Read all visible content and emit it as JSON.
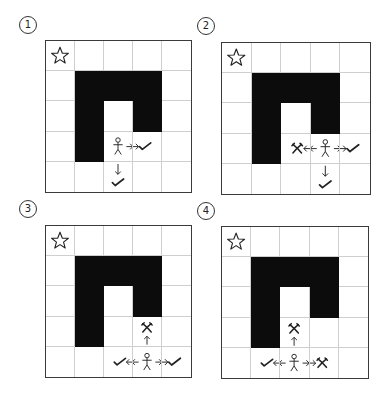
{
  "figure": {
    "grid_size": 5,
    "walls": [
      [
        1,
        1
      ],
      [
        1,
        2
      ],
      [
        1,
        3
      ],
      [
        2,
        1
      ],
      [
        2,
        3
      ],
      [
        3,
        1
      ]
    ],
    "star": [
      0,
      0
    ],
    "panels": [
      {
        "label": "1",
        "position": {
          "label_x": 19,
          "label_y": 16,
          "grid_x": 45,
          "grid_y": 40,
          "grid_w": 147,
          "grid_h": 153
        },
        "agent": [
          3,
          2
        ],
        "moves": [
          {
            "direction": "right",
            "result": "check"
          },
          {
            "direction": "down",
            "result": "check"
          }
        ]
      },
      {
        "label": "2",
        "position": {
          "label_x": 197,
          "label_y": 17,
          "grid_x": 221,
          "grid_y": 42,
          "grid_w": 150,
          "grid_h": 153
        },
        "agent": [
          3,
          3
        ],
        "moves": [
          {
            "direction": "left",
            "result": "cross"
          },
          {
            "direction": "right",
            "result": "check"
          },
          {
            "direction": "down",
            "result": "check"
          }
        ]
      },
      {
        "label": "3",
        "position": {
          "label_x": 19,
          "label_y": 200,
          "grid_x": 45,
          "grid_y": 225,
          "grid_w": 147,
          "grid_h": 153
        },
        "agent": [
          4,
          3
        ],
        "moves": [
          {
            "direction": "up",
            "result": "cross"
          },
          {
            "direction": "left",
            "result": "check"
          },
          {
            "direction": "right",
            "result": "check"
          }
        ]
      },
      {
        "label": "4",
        "position": {
          "label_x": 197,
          "label_y": 202,
          "grid_x": 221,
          "grid_y": 226,
          "grid_w": 148,
          "grid_h": 153
        },
        "agent": [
          4,
          2
        ],
        "moves": [
          {
            "direction": "up",
            "result": "cross"
          },
          {
            "direction": "left",
            "result": "check"
          },
          {
            "direction": "right",
            "result": "cross"
          }
        ]
      }
    ],
    "icons": {
      "star": "star-icon",
      "agent": "stick-figure-icon",
      "check": "checkmark-icon",
      "cross": "cross-icon",
      "arrow": "arrow-icon"
    },
    "colors": {
      "wall": "#0c0c0c",
      "gridline": "#cfcfcf",
      "border": "#3a3a3a",
      "ink": "#222222"
    }
  }
}
